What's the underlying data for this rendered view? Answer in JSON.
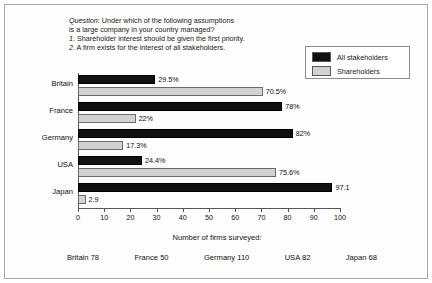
{
  "question": {
    "lead": "Question:",
    "lines": [
      "Question: Under which of the following assumptions",
      "is a large company in your country managed?",
      "1. Shareholder interest should be given the first priority.",
      "2. A firm exists for the interest of all stakeholders."
    ]
  },
  "legend": {
    "items": [
      {
        "label": "All stakeholders",
        "color": "#111111"
      },
      {
        "label": "Shareholders",
        "color": "#d2d2d2"
      }
    ]
  },
  "caption": {
    "title": "Number of firms surveyed:",
    "items": [
      "Britain 78",
      "France 50",
      "Germany 110",
      "USA 82",
      "Japan 68"
    ]
  },
  "chart_data": {
    "type": "bar",
    "orientation": "horizontal",
    "title": "",
    "xlabel": "",
    "ylabel": "",
    "xlim": [
      0,
      100
    ],
    "xticks": [
      0,
      10,
      20,
      30,
      40,
      50,
      60,
      70,
      80,
      90,
      100
    ],
    "xtick_labels": [
      "0",
      "10",
      "20",
      "30",
      "40",
      "50",
      "60",
      "70",
      "80",
      "90",
      "100"
    ],
    "grid": false,
    "legend_position": "top-right",
    "categories": [
      "Britain",
      "France",
      "Germany",
      "USA",
      "Japan"
    ],
    "series": [
      {
        "name": "All stakeholders",
        "color": "#111111",
        "values": [
          29.5,
          78,
          82,
          24.4,
          97.1
        ],
        "labels": [
          "29.5%",
          "78%",
          "82%",
          "24.4%",
          "97.1"
        ]
      },
      {
        "name": "Shareholders",
        "color": "#d2d2d2",
        "values": [
          70.5,
          22,
          17.3,
          75.6,
          2.9
        ],
        "labels": [
          "70.5%",
          "22%",
          "17.3%",
          "75.6%",
          "2.9"
        ]
      }
    ],
    "firms_surveyed": {
      "Britain": 78,
      "France": 50,
      "Germany": 110,
      "USA": 82,
      "Japan": 68
    }
  }
}
